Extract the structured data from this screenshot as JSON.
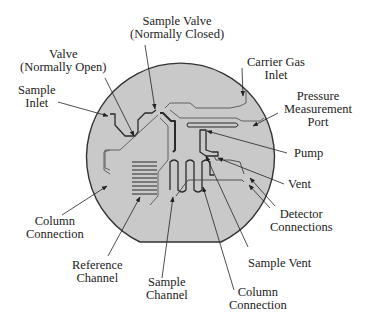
{
  "colors": {
    "wafer_fill": "#c9c9c9",
    "wafer_outline": "#333333",
    "channel": "#2a2a2a",
    "text": "#222222"
  },
  "labels": {
    "sample_valve": {
      "line1": "Sample Valve",
      "line2": "(Normally Closed)"
    },
    "valve": {
      "line1": "Valve",
      "line2": "(Normally Open)"
    },
    "sample_inlet": {
      "line1": "Sample",
      "line2": "Inlet"
    },
    "carrier_gas_inlet": {
      "line1": "Carrier Gas",
      "line2": "Inlet"
    },
    "pressure_port": {
      "line1": "Pressure",
      "line2": "Measurement",
      "line3": "Port"
    },
    "pump": {
      "line1": "Pump"
    },
    "vent": {
      "line1": "Vent"
    },
    "detector_connections": {
      "line1": "Detector",
      "line2": "Connections"
    },
    "column_connection_left": {
      "line1": "Column",
      "line2": "Connection"
    },
    "reference_channel": {
      "line1": "Reference",
      "line2": "Channel"
    },
    "sample_channel": {
      "line1": "Sample",
      "line2": "Channel"
    },
    "sample_vent": {
      "line1": "Sample Vent"
    },
    "column_connection_bottom": {
      "line1": "Column",
      "line2": "Connection"
    }
  }
}
